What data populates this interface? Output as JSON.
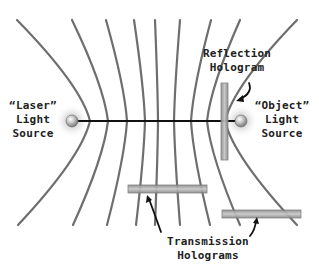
{
  "diagram": {
    "labels": {
      "laser_source": [
        "“Laser”",
        "Light",
        "Source"
      ],
      "object_source": [
        "“Object”",
        "Light",
        "Source"
      ],
      "reflection_hologram": [
        "Reflection",
        "Hologram"
      ],
      "transmission_holograms": [
        "Transmission",
        "Holograms"
      ]
    },
    "colors": {
      "fringe": "#6e6e6e",
      "beam": "#111111",
      "hologram_plate": "#9a9a9a",
      "hologram_highlight": "#c8c8c8",
      "source_sphere": "#bdbdbd",
      "text": "#222222",
      "background": "#ffffff"
    },
    "nodes": [
      {
        "id": "laser-source",
        "x": 72,
        "y": 121
      },
      {
        "id": "object-source",
        "x": 241,
        "y": 121
      }
    ],
    "edges": [
      {
        "from": "laser-source",
        "to": "object-source",
        "kind": "beam"
      }
    ],
    "fringes": [
      {
        "top": [
          17,
          20
        ],
        "mid": [
          90,
          121
        ],
        "bottom": [
          18,
          225
        ]
      },
      {
        "top": [
          72,
          20
        ],
        "mid": [
          108,
          121
        ],
        "bottom": [
          73,
          225
        ]
      },
      {
        "top": [
          106,
          20
        ],
        "mid": [
          127,
          121
        ],
        "bottom": [
          107,
          225
        ]
      },
      {
        "top": [
          134,
          20
        ],
        "mid": [
          145,
          121
        ],
        "bottom": [
          136,
          225
        ]
      },
      {
        "top": [
          155,
          20
        ],
        "mid": [
          158,
          121
        ],
        "bottom": [
          155,
          225
        ]
      },
      {
        "top": [
          180,
          20
        ],
        "mid": [
          174,
          121
        ],
        "bottom": [
          180,
          225
        ]
      },
      {
        "top": [
          211,
          20
        ],
        "mid": [
          191,
          121
        ],
        "bottom": [
          210,
          225
        ]
      },
      {
        "top": [
          240,
          20
        ],
        "mid": [
          207,
          121
        ],
        "bottom": [
          240,
          225
        ]
      },
      {
        "top": [
          297,
          20
        ],
        "mid": [
          225,
          121
        ],
        "bottom": [
          297,
          225
        ]
      }
    ],
    "holograms": [
      {
        "id": "reflection-hologram",
        "orientation": "vertical",
        "x": 221,
        "y": 83,
        "w": 7,
        "h": 77
      },
      {
        "id": "transmission-hologram-1",
        "orientation": "horizontal",
        "x": 128,
        "y": 185,
        "w": 79,
        "h": 8
      },
      {
        "id": "transmission-hologram-2",
        "orientation": "horizontal",
        "x": 222,
        "y": 210,
        "w": 79,
        "h": 8
      }
    ]
  }
}
